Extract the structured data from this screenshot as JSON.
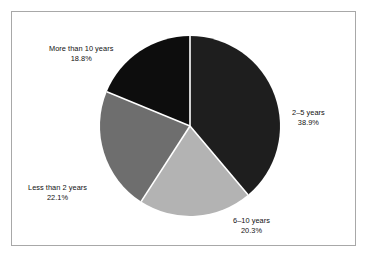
{
  "figure": {
    "background_color": "#ffffff",
    "frame_color": "#a8a8a8"
  },
  "chart_data": {
    "type": "pie",
    "title": "",
    "subtitle": "",
    "xlabel": "",
    "ylabel": "",
    "legend_position": "none",
    "grid": false,
    "start_angle_deg": 90,
    "direction": "clockwise",
    "categories": [
      "2–5 years",
      "6–10 years",
      "Less than 2 years",
      "More than 10 years"
    ],
    "values": [
      38.9,
      20.3,
      22.1,
      18.8
    ],
    "value_unit": "percent",
    "colors": [
      "#1e1e1e",
      "#b3b3b3",
      "#6e6e6e",
      "#0d0d0d"
    ],
    "slice_separator_color": "#ffffff",
    "slices": [
      {
        "label": "2–5 years",
        "percent_text": "38.9%",
        "value": 38.9,
        "color": "#1e1e1e",
        "label_position": "right"
      },
      {
        "label": "6–10 years",
        "percent_text": "20.3%",
        "value": 20.3,
        "color": "#b3b3b3",
        "label_position": "bottom"
      },
      {
        "label": "Less than 2 years",
        "percent_text": "22.1%",
        "value": 22.1,
        "color": "#6e6e6e",
        "label_position": "left"
      },
      {
        "label": "More than 10 years",
        "percent_text": "18.8%",
        "value": 18.8,
        "color": "#0d0d0d",
        "label_position": "top-left"
      }
    ]
  }
}
